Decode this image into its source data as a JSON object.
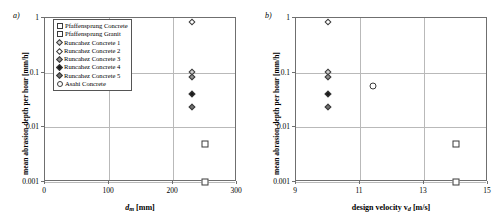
{
  "figure": {
    "panels": [
      {
        "tag": "a)",
        "xlabel_main": "d",
        "xlabel_sub": "m",
        "xlabel_unit": "[mm]",
        "ylabel": "mean abrasion depth per hour [mm/h]",
        "xticks": [
          "0",
          "100",
          "200",
          "300"
        ],
        "yticks": [
          "1",
          "0.1",
          "0.01",
          "0.001"
        ]
      },
      {
        "tag": "b)",
        "xlabel_main": "design velocity v",
        "xlabel_sub": "d",
        "xlabel_unit": "[m/s]",
        "ylabel": "mean abrasion depth per hour [mm/h]",
        "xticks": [
          "9",
          "11",
          "13",
          "15"
        ],
        "yticks": [
          "1",
          "0.1",
          "0.01",
          "0.001"
        ]
      }
    ],
    "legend": [
      {
        "label": "Pfaffensprung Concrete",
        "marker": "square-open-marker",
        "fill": "#ffffff"
      },
      {
        "label": "Pfaffensprung Granit",
        "marker": "square-open-marker",
        "fill": "#ffffff"
      },
      {
        "label": "Runcahez Concrete 1",
        "marker": "diamond-lightgray-marker",
        "fill": "#d0d0d0"
      },
      {
        "label": "Runcahez Concrete 2",
        "marker": "diamond-open-marker",
        "fill": "#ffffff"
      },
      {
        "label": "Runcahez Concrete 3",
        "marker": "diamond-gray-marker",
        "fill": "#909090"
      },
      {
        "label": "Runcahez Concrete 4",
        "marker": "diamond-black-marker",
        "fill": "#1a1a1a"
      },
      {
        "label": "Runcahez Concrete 5",
        "marker": "diamond-darkgray-marker",
        "fill": "#707070"
      },
      {
        "label": "Asahi Concrete",
        "marker": "circle-open-marker",
        "fill": "#ffffff"
      }
    ]
  },
  "chart_data": [
    {
      "type": "scatter",
      "title": "a)",
      "xlabel": "d_m [mm]",
      "ylabel": "mean abrasion depth per hour [mm/h]",
      "xlim": [
        0,
        300
      ],
      "ylim": [
        0.001,
        1
      ],
      "yscale": "log",
      "xticks": [
        0,
        100,
        200,
        300
      ],
      "yticks": [
        1,
        0.1,
        0.01,
        0.001
      ],
      "grid": true,
      "legend_position": "top-left-inside",
      "series": [
        {
          "name": "Pfaffensprung Concrete",
          "marker": "square-open",
          "points": [
            {
              "x": 250,
              "y": 0.005
            }
          ]
        },
        {
          "name": "Pfaffensprung Granit",
          "marker": "square-open",
          "points": [
            {
              "x": 250,
              "y": 0.001
            }
          ]
        },
        {
          "name": "Runcahez Concrete 1",
          "marker": "diamond-lightgray",
          "points": [
            {
              "x": 230,
              "y": 0.105
            }
          ]
        },
        {
          "name": "Runcahez Concrete 2",
          "marker": "diamond-open",
          "points": [
            {
              "x": 230,
              "y": 0.85
            }
          ]
        },
        {
          "name": "Runcahez Concrete 3",
          "marker": "diamond-gray",
          "points": [
            {
              "x": 230,
              "y": 0.082
            }
          ]
        },
        {
          "name": "Runcahez Concrete 4",
          "marker": "diamond-black",
          "points": [
            {
              "x": 230,
              "y": 0.041
            }
          ]
        },
        {
          "name": "Runcahez Concrete 5",
          "marker": "diamond-darkgray",
          "points": [
            {
              "x": 230,
              "y": 0.024
            }
          ]
        },
        {
          "name": "Asahi Concrete",
          "marker": "circle-open",
          "points": [
            {
              "x": 48,
              "y": 0.057
            }
          ]
        }
      ]
    },
    {
      "type": "scatter",
      "title": "b)",
      "xlabel": "design velocity v_d [m/s]",
      "ylabel": "mean abrasion depth per hour [mm/h]",
      "xlim": [
        9,
        15
      ],
      "ylim": [
        0.001,
        1
      ],
      "yscale": "log",
      "xticks": [
        9,
        11,
        13,
        15
      ],
      "yticks": [
        1,
        0.1,
        0.01,
        0.001
      ],
      "grid": true,
      "legend_position": "none",
      "series": [
        {
          "name": "Pfaffensprung Concrete",
          "marker": "square-open",
          "points": [
            {
              "x": 14.0,
              "y": 0.005
            }
          ]
        },
        {
          "name": "Pfaffensprung Granit",
          "marker": "square-open",
          "points": [
            {
              "x": 14.0,
              "y": 0.001
            }
          ]
        },
        {
          "name": "Runcahez Concrete 1",
          "marker": "diamond-lightgray",
          "points": [
            {
              "x": 10.0,
              "y": 0.105
            }
          ]
        },
        {
          "name": "Runcahez Concrete 2",
          "marker": "diamond-open",
          "points": [
            {
              "x": 10.0,
              "y": 0.85
            }
          ]
        },
        {
          "name": "Runcahez Concrete 3",
          "marker": "diamond-gray",
          "points": [
            {
              "x": 10.0,
              "y": 0.082
            }
          ]
        },
        {
          "name": "Runcahez Concrete 4",
          "marker": "diamond-black",
          "points": [
            {
              "x": 10.0,
              "y": 0.041
            }
          ]
        },
        {
          "name": "Runcahez Concrete 5",
          "marker": "diamond-darkgray",
          "points": [
            {
              "x": 10.0,
              "y": 0.024
            }
          ]
        },
        {
          "name": "Asahi Concrete",
          "marker": "circle-open",
          "points": [
            {
              "x": 11.4,
              "y": 0.057
            }
          ]
        }
      ]
    }
  ]
}
